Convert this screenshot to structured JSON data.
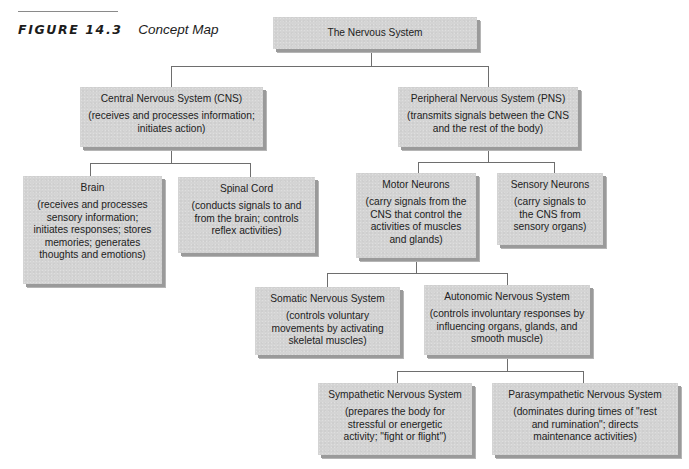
{
  "figure": {
    "label": "FIGURE 14.3",
    "title": "Concept Map"
  },
  "nodes": {
    "root": {
      "name": "The Nervous System",
      "desc": ""
    },
    "cns": {
      "name": "Central Nervous System (CNS)",
      "desc": "(receives and processes information; initiates action)"
    },
    "pns": {
      "name": "Peripheral Nervous System (PNS)",
      "desc": "(transmits signals between the CNS and the rest of the body)"
    },
    "brain": {
      "name": "Brain",
      "desc": "(receives and processes sensory information; initiates responses; stores memories; generates thoughts and emotions)"
    },
    "spinal_cord": {
      "name": "Spinal Cord",
      "desc": "(conducts signals to and from the brain; controls reflex activities)"
    },
    "motor_neurons": {
      "name": "Motor Neurons",
      "desc": "(carry signals from the CNS that control the activities of muscles and glands)"
    },
    "sensory_neurons": {
      "name": "Sensory Neurons",
      "desc": "(carry signals to the CNS from sensory organs)"
    },
    "somatic": {
      "name": "Somatic Nervous System",
      "desc": "(controls voluntary movements by activating skeletal muscles)"
    },
    "autonomic": {
      "name": "Autonomic Nervous System",
      "desc": "(controls involuntary responses by influencing organs, glands, and smooth muscle)"
    },
    "sympathetic": {
      "name": "Sympathetic Nervous System",
      "desc": "(prepares the body for stressful or energetic activity; \"fight or flight\")"
    },
    "parasympathetic": {
      "name": "Parasympathetic Nervous System",
      "desc": "(dominates during times of \"rest and rumination\"; directs maintenance activities)"
    }
  },
  "edges": [
    [
      "root",
      "cns"
    ],
    [
      "root",
      "pns"
    ],
    [
      "cns",
      "brain"
    ],
    [
      "cns",
      "spinal_cord"
    ],
    [
      "pns",
      "motor_neurons"
    ],
    [
      "pns",
      "sensory_neurons"
    ],
    [
      "motor_neurons",
      "somatic"
    ],
    [
      "motor_neurons",
      "autonomic"
    ],
    [
      "autonomic",
      "sympathetic"
    ],
    [
      "autonomic",
      "parasympathetic"
    ]
  ],
  "colors": {
    "box_fill": "#d4d4d4",
    "box_shadow": "#9a9a9a",
    "connector": "#6e6e6e",
    "text": "#222222"
  }
}
